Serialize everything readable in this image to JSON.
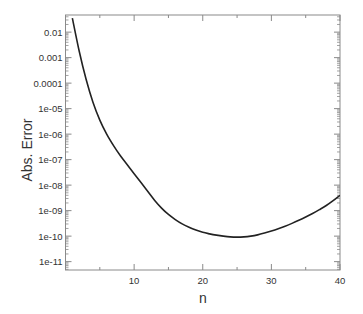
{
  "chart_data": {
    "type": "line",
    "title": "",
    "xlabel": "n",
    "ylabel": "Abs. Error",
    "xlim": [
      0,
      40
    ],
    "ylim": [
      4.7e-12,
      0.047
    ],
    "yscale": "log",
    "grid": false,
    "legend": null,
    "x_ticks": [
      10,
      20,
      30,
      40
    ],
    "x_tick_labels": [
      "10",
      "20",
      "30",
      "40"
    ],
    "x_minor_ticks": [
      5,
      15,
      25,
      35
    ],
    "y_ticks": [
      0.01,
      0.001,
      0.0001,
      1e-05,
      1e-06,
      1e-07,
      1e-08,
      1e-09,
      1e-10,
      1e-11
    ],
    "y_tick_labels": [
      "0.01",
      "0.001",
      "0.0001",
      "1e-05",
      "1e-06",
      "1e-07",
      "1e-08",
      "1e-09",
      "1e-10",
      "1e-11"
    ],
    "series": [
      {
        "name": "Abs. Error",
        "color": "#222222",
        "x": [
          1,
          2,
          3,
          4,
          5,
          6,
          7,
          8,
          9,
          10,
          11,
          12,
          13,
          14,
          15,
          16,
          17,
          18,
          19,
          20,
          21,
          22,
          23,
          24,
          25,
          26,
          27,
          28,
          29,
          30,
          31,
          32,
          33,
          34,
          35,
          36,
          37,
          38,
          39,
          40
        ],
        "log10_values": [
          -1.45,
          -2.75,
          -3.85,
          -4.75,
          -5.45,
          -6.0,
          -6.45,
          -6.85,
          -7.2,
          -7.55,
          -7.9,
          -8.25,
          -8.6,
          -8.9,
          -9.15,
          -9.35,
          -9.52,
          -9.65,
          -9.76,
          -9.85,
          -9.91,
          -9.96,
          -10.0,
          -10.03,
          -10.04,
          -10.03,
          -10.0,
          -9.95,
          -9.88,
          -9.8,
          -9.71,
          -9.61,
          -9.5,
          -9.38,
          -9.25,
          -9.11,
          -8.96,
          -8.8,
          -8.61,
          -8.4
        ],
        "values": [
          0.035,
          0.0018,
          0.00014,
          1.8e-05,
          3.5e-06,
          1e-06,
          3.5e-07,
          1.4e-07,
          6.3e-08,
          2.8e-08,
          1.3e-08,
          5.6e-09,
          2.5e-09,
          1.3e-09,
          7.1e-10,
          4.5e-10,
          3e-10,
          2.2e-10,
          1.7e-10,
          1.4e-10,
          1.2e-10,
          1.1e-10,
          1e-10,
          9.3e-11,
          9.1e-11,
          9.3e-11,
          1e-10,
          1.1e-10,
          1.3e-10,
          1.6e-10,
          1.9e-10,
          2.5e-10,
          3.2e-10,
          4.2e-10,
          5.6e-10,
          7.8e-10,
          1.1e-09,
          1.6e-09,
          2.5e-09,
          4e-09
        ]
      }
    ]
  }
}
